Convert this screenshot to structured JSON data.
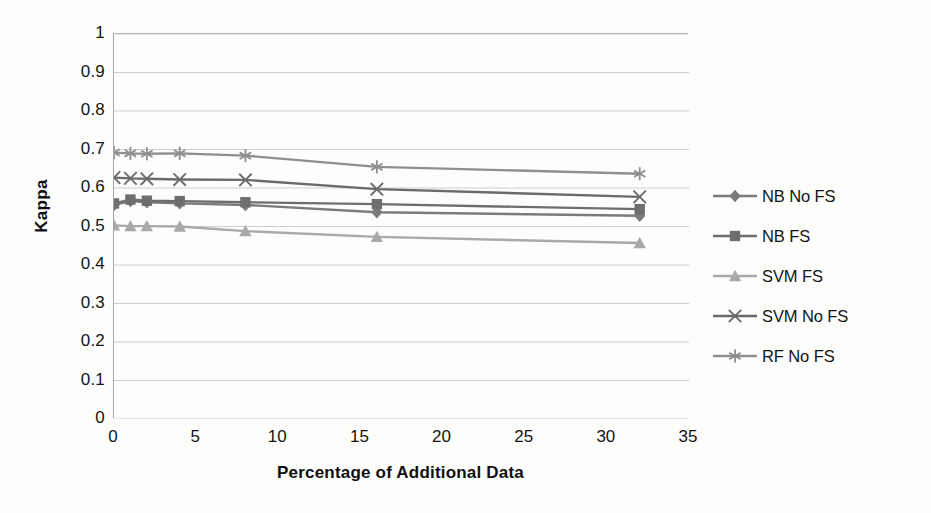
{
  "chart_data": {
    "type": "line",
    "title": "",
    "xlabel": "Percentage of Additional Data",
    "ylabel": "Kappa",
    "xlim": [
      0,
      35
    ],
    "ylim": [
      0,
      1
    ],
    "xticks": [
      0,
      5,
      10,
      15,
      20,
      25,
      30,
      35
    ],
    "yticks": [
      0,
      0.1,
      0.2,
      0.3,
      0.4,
      0.5,
      0.6,
      0.7,
      0.8,
      0.9,
      1
    ],
    "ytick_labels": [
      "0",
      "0.1",
      "0.2",
      "0.3",
      "0.4",
      "0.5",
      "0.6",
      "0.7",
      "0.8",
      "0.9",
      "1"
    ],
    "xtick_labels": [
      "0",
      "5",
      "10",
      "15",
      "20",
      "25",
      "30",
      "35"
    ],
    "grid": "horizontal",
    "legend_position": "right",
    "x": [
      0,
      1,
      2,
      4,
      8,
      16,
      32
    ],
    "series": [
      {
        "name": "NB No FS",
        "marker": "diamond",
        "color": "#7b7b7b",
        "values": [
          0.556,
          0.566,
          0.563,
          0.56,
          0.556,
          0.537,
          0.528
        ]
      },
      {
        "name": "NB FS",
        "marker": "square",
        "color": "#6e6e6e",
        "values": [
          0.56,
          0.57,
          0.567,
          0.566,
          0.563,
          0.558,
          0.545
        ]
      },
      {
        "name": "SVM FS",
        "marker": "triangle",
        "color": "#a9a9a9",
        "values": [
          0.503,
          0.501,
          0.501,
          0.5,
          0.488,
          0.473,
          0.457
        ]
      },
      {
        "name": "SVM No FS",
        "marker": "cross",
        "color": "#6a6a6a",
        "values": [
          0.627,
          0.625,
          0.624,
          0.622,
          0.621,
          0.597,
          0.577
        ]
      },
      {
        "name": "RF No FS",
        "marker": "asterisk",
        "color": "#8f8f8f",
        "values": [
          0.692,
          0.69,
          0.689,
          0.69,
          0.684,
          0.655,
          0.637
        ]
      }
    ]
  },
  "axis": {
    "y_title": "Kappa",
    "x_title": "Percentage of Additional Data"
  },
  "colors": {
    "grid": "#c8c8c8",
    "axis": "#a6a6a6",
    "text": "#141414",
    "background": "#fdfdfc"
  }
}
